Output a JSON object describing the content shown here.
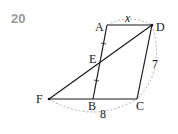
{
  "problem_number": "20",
  "diagram": {
    "points": {
      "A": {
        "label": "A",
        "x": 107,
        "y": 25
      },
      "D": {
        "label": "D",
        "x": 152,
        "y": 25
      },
      "E": {
        "label": "E",
        "x": 100,
        "y": 61
      },
      "F": {
        "label": "F",
        "x": 49,
        "y": 99
      },
      "B": {
        "label": "B",
        "x": 93,
        "y": 99
      },
      "C": {
        "label": "C",
        "x": 137,
        "y": 99
      }
    },
    "segments": [
      "AD",
      "AB",
      "DC",
      "FC",
      "FD"
    ],
    "equal_marks": [
      "AE",
      "EB"
    ],
    "measurements": {
      "AD": "x",
      "DC": "7",
      "FC": "8"
    },
    "colors": {
      "line": "#1a1a1a",
      "dashed": "#9a9a9a",
      "number": "#9a9a9a"
    }
  }
}
